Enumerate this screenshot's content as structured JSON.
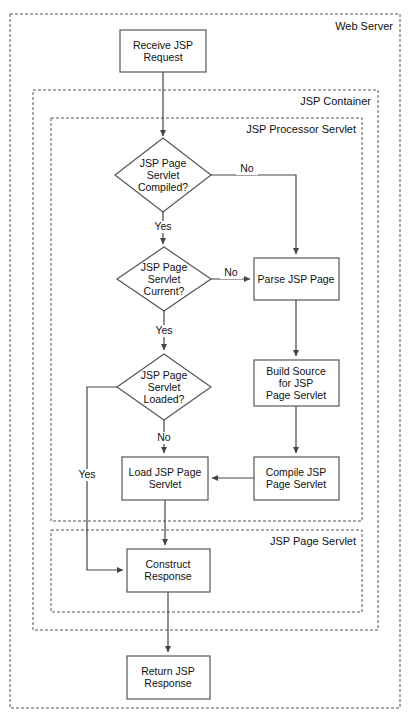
{
  "diagram": {
    "colors": {
      "background": "#ffffff",
      "container_stroke": "#555555",
      "node_stroke": "#555555",
      "node_fill": "#ffffff",
      "edge_stroke": "#444444",
      "text": "#111111"
    },
    "containers": [
      {
        "id": "web-server",
        "label": "Web Server",
        "x": 10,
        "y": 14,
        "w": 390,
        "h": 694,
        "label_x": 393,
        "label_y": 30
      },
      {
        "id": "jsp-container",
        "label": "JSP Container",
        "x": 33,
        "y": 90,
        "w": 345,
        "h": 540,
        "label_x": 371,
        "label_y": 105
      },
      {
        "id": "jsp-processor-servlet",
        "label": "JSP Processor Servlet",
        "x": 51,
        "y": 118,
        "w": 311,
        "h": 403,
        "label_x": 356,
        "label_y": 133
      },
      {
        "id": "jsp-page-servlet",
        "label": "JSP Page Servlet",
        "x": 51,
        "y": 530,
        "w": 311,
        "h": 82,
        "label_x": 356,
        "label_y": 545
      }
    ],
    "nodes": [
      {
        "id": "receive-jsp-request",
        "shape": "rect",
        "lines": [
          "Receive JSP",
          "Request"
        ],
        "x": 120,
        "y": 30,
        "w": 86,
        "h": 42,
        "cx": 163,
        "cy": 51
      },
      {
        "id": "jsp-page-servlet-compiled",
        "shape": "diamond",
        "lines": [
          "JSP Page",
          "Servlet",
          "Compiled?"
        ],
        "cx": 163,
        "cy": 175,
        "rx": 48,
        "ry": 37
      },
      {
        "id": "jsp-page-servlet-current",
        "shape": "diamond",
        "lines": [
          "JSP Page",
          "Servlet",
          "Current?"
        ],
        "cx": 164,
        "cy": 279,
        "rx": 47,
        "ry": 32
      },
      {
        "id": "jsp-page-servlet-loaded",
        "shape": "diamond",
        "lines": [
          "JSP Page",
          "Servlet",
          "Loaded?"
        ],
        "cx": 164,
        "cy": 387,
        "rx": 47,
        "ry": 33
      },
      {
        "id": "parse-jsp-page",
        "shape": "rect",
        "lines": [
          "Parse JSP Page"
        ],
        "x": 254,
        "y": 258,
        "w": 85,
        "h": 42,
        "cx": 296,
        "cy": 279
      },
      {
        "id": "build-source-for-jsp-page-servlet",
        "shape": "rect",
        "lines": [
          "Build Source",
          "for JSP",
          "Page Servlet"
        ],
        "x": 254,
        "y": 360,
        "w": 85,
        "h": 46,
        "cx": 296,
        "cy": 383
      },
      {
        "id": "compile-jsp-page-servlet",
        "shape": "rect",
        "lines": [
          "Compile JSP",
          "Page Servlet"
        ],
        "x": 254,
        "y": 457,
        "w": 85,
        "h": 43,
        "cx": 296,
        "cy": 478
      },
      {
        "id": "load-jsp-page-servlet",
        "shape": "rect",
        "lines": [
          "Load JSP Page",
          "Servlet"
        ],
        "x": 122,
        "y": 457,
        "w": 86,
        "h": 43,
        "cx": 165,
        "cy": 478
      },
      {
        "id": "construct-response",
        "shape": "rect",
        "lines": [
          "Construct",
          "Response"
        ],
        "x": 127,
        "y": 549,
        "w": 83,
        "h": 43,
        "cx": 168,
        "cy": 570
      },
      {
        "id": "return-jsp-response",
        "shape": "rect",
        "lines": [
          "Return JSP",
          "Response"
        ],
        "x": 127,
        "y": 656,
        "w": 83,
        "h": 43,
        "cx": 168,
        "cy": 677
      }
    ],
    "edges": [
      {
        "id": "receive-to-compiled",
        "from": "receive-jsp-request",
        "to": "jsp-page-servlet-compiled",
        "path": "M163,72 L163,136",
        "arrow": true
      },
      {
        "id": "compiled-no-to-parse",
        "from": "jsp-page-servlet-compiled",
        "to": "parse-jsp-page",
        "path": "M211,175 L296,175 L296,254",
        "arrow": true,
        "label": "No",
        "label_x": 247,
        "label_y": 172
      },
      {
        "id": "compiled-yes-to-current",
        "from": "jsp-page-servlet-compiled",
        "to": "jsp-page-servlet-current",
        "path": "M163,212 L163,244",
        "arrow": true,
        "label": "Yes",
        "label_x": 163,
        "label_y": 230
      },
      {
        "id": "current-no-to-parse",
        "from": "jsp-page-servlet-current",
        "to": "parse-jsp-page",
        "path": "M211,279 L250,279",
        "arrow": true,
        "label": "No",
        "label_x": 231,
        "label_y": 276
      },
      {
        "id": "current-yes-to-loaded",
        "from": "jsp-page-servlet-current",
        "to": "jsp-page-servlet-loaded",
        "path": "M164,311 L164,350",
        "arrow": true,
        "label": "Yes",
        "label_x": 164,
        "label_y": 334
      },
      {
        "id": "parse-to-build",
        "from": "parse-jsp-page",
        "to": "build-source-for-jsp-page-servlet",
        "path": "M296,300 L296,356",
        "arrow": true
      },
      {
        "id": "build-to-compile",
        "from": "build-source-for-jsp-page-servlet",
        "to": "compile-jsp-page-servlet",
        "path": "M296,406 L296,453",
        "arrow": true
      },
      {
        "id": "compile-to-load",
        "from": "compile-jsp-page-servlet",
        "to": "load-jsp-page-servlet",
        "path": "M254,478 L212,478",
        "arrow": true
      },
      {
        "id": "loaded-no-to-load",
        "from": "jsp-page-servlet-loaded",
        "to": "load-jsp-page-servlet",
        "path": "M164,420 L164,453",
        "arrow": true,
        "label": "No",
        "label_x": 164,
        "label_y": 441
      },
      {
        "id": "loaded-yes-to-construct",
        "from": "jsp-page-servlet-loaded",
        "to": "construct-response",
        "path": "M117,387 L87,387 L87,570 L123,570",
        "arrow": true,
        "label": "Yes",
        "label_x": 87,
        "label_y": 478
      },
      {
        "id": "load-to-construct",
        "from": "load-jsp-page-servlet",
        "to": "construct-response",
        "path": "M165,500 L165,545",
        "arrow": true
      },
      {
        "id": "construct-to-return",
        "from": "construct-response",
        "to": "return-jsp-response",
        "path": "M168,592 L168,652",
        "arrow": true
      }
    ]
  }
}
